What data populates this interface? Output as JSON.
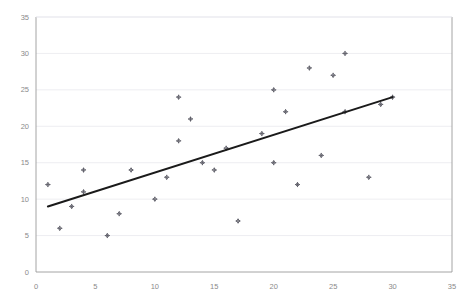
{
  "chart_data": {
    "type": "scatter",
    "title": "",
    "subtitle": "",
    "xlabel": "",
    "ylabel": "",
    "xlim": [
      0,
      35
    ],
    "ylim": [
      0,
      35
    ],
    "xticks": [
      0,
      5,
      10,
      15,
      20,
      25,
      30,
      35
    ],
    "yticks": [
      0,
      5,
      10,
      15,
      20,
      25,
      30,
      35
    ],
    "xtick_labels": [
      "0",
      "5",
      "10",
      "15",
      "20",
      "25",
      "30",
      "35"
    ],
    "ytick_labels": [
      "0",
      "5",
      "10",
      "15",
      "20",
      "25",
      "30",
      "35"
    ],
    "grid": "horizontal",
    "legend": "none",
    "marker_style": "small-diamond-outline",
    "marker_color": "#555560",
    "series": [
      {
        "name": "observations",
        "points": [
          [
            1,
            12
          ],
          [
            2,
            6
          ],
          [
            3,
            9
          ],
          [
            4,
            11
          ],
          [
            4,
            14
          ],
          [
            6,
            5
          ],
          [
            7,
            8
          ],
          [
            8,
            14
          ],
          [
            10,
            10
          ],
          [
            11,
            13
          ],
          [
            12,
            18
          ],
          [
            12,
            24
          ],
          [
            13,
            21
          ],
          [
            14,
            15
          ],
          [
            15,
            14
          ],
          [
            16,
            17
          ],
          [
            17,
            7
          ],
          [
            19,
            19
          ],
          [
            20,
            15
          ],
          [
            20,
            25
          ],
          [
            21,
            22
          ],
          [
            22,
            12
          ],
          [
            23,
            28
          ],
          [
            24,
            16
          ],
          [
            25,
            27
          ],
          [
            26,
            22
          ],
          [
            26,
            30
          ],
          [
            28,
            13
          ],
          [
            29,
            23
          ],
          [
            30,
            24
          ]
        ]
      }
    ],
    "trendline": {
      "type": "linear-fit",
      "x_start": 1,
      "y_start": 9,
      "x_end": 30,
      "y_end": 24,
      "color": "#1a1a1a"
    },
    "colors": {
      "background": "#ffffff",
      "grid": "#e9e9ee",
      "axis": "#9a9a9a",
      "tick_text": "#8a8a8a",
      "marker": "#555560",
      "trend": "#1a1a1a"
    }
  }
}
